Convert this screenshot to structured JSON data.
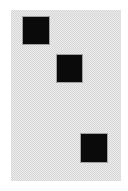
{
  "canvas": {
    "width": 128,
    "height": 191,
    "background": "#ffffff"
  },
  "card": {
    "x": 11,
    "y": 10,
    "width": 110,
    "height": 171,
    "pattern": "dithered-checkerboard",
    "colors": [
      "#ececec",
      "#d6d6d6"
    ]
  },
  "squares": [
    {
      "id": "square-1",
      "x": 23,
      "y": 17,
      "width": 26,
      "height": 27,
      "color": "#0a0a0a"
    },
    {
      "id": "square-2",
      "x": 57,
      "y": 55,
      "width": 25,
      "height": 27,
      "color": "#0a0a0a"
    },
    {
      "id": "square-3",
      "x": 81,
      "y": 134,
      "width": 26,
      "height": 28,
      "color": "#0a0a0a"
    }
  ]
}
